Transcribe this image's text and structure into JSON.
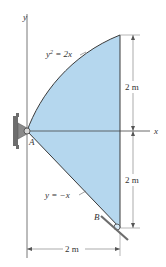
{
  "diagram": {
    "colors": {
      "region_fill": "#b5d7ee",
      "outline": "#3a3a3a",
      "axis": "#555555",
      "support": "#6d6d6d"
    },
    "axes": {
      "x_label": "x",
      "y_label": "y"
    },
    "curves": {
      "upper": "y² = 2x",
      "upper_base": "y",
      "upper_sup": "2",
      "upper_rest": " = 2x",
      "lower": "y = −x"
    },
    "points": {
      "A": "A",
      "B": "B"
    },
    "dimensions": {
      "upper_height": "2 m",
      "lower_height": "2 m",
      "width": "2 m"
    }
  }
}
